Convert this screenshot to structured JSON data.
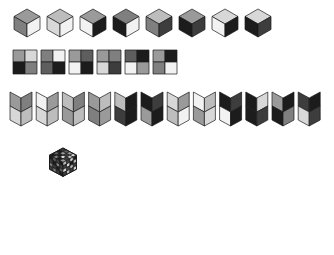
{
  "figure": {
    "background": "#ffffff",
    "outline_color": "#1a1a1a",
    "palette": {
      "black": "#1c1c1c",
      "dark": "#3d3d3d",
      "mid_dark": "#5e5e5e",
      "mid": "#7f7f7f",
      "mid_light": "#9a9a9a",
      "light": "#bdbdbd",
      "lighter": "#d8d8d8",
      "white": "#f2f2f2"
    }
  },
  "rows": [
    {
      "name": "cube-row",
      "label": "Row 1 — isometric cubes",
      "count": 8,
      "origin_x": 14,
      "origin_y": 9,
      "step_x": 33,
      "cube_half_width": 13,
      "cube_top_height": 7.5,
      "cube_side_height": 13,
      "items": [
        {
          "id": "cube-1",
          "top": "#9a9a9a",
          "left": "#7f7f7f",
          "right": "#f2f2f2"
        },
        {
          "id": "cube-2",
          "top": "#bdbdbd",
          "left": "#d8d8d8",
          "right": "#f2f2f2"
        },
        {
          "id": "cube-3",
          "top": "#9a9a9a",
          "left": "#f2f2f2",
          "right": "#1c1c1c"
        },
        {
          "id": "cube-4",
          "top": "#7f7f7f",
          "left": "#1c1c1c",
          "right": "#f2f2f2"
        },
        {
          "id": "cube-5",
          "top": "#bdbdbd",
          "left": "#7f7f7f",
          "right": "#3d3d3d"
        },
        {
          "id": "cube-6",
          "top": "#9a9a9a",
          "left": "#1c1c1c",
          "right": "#3d3d3d"
        },
        {
          "id": "cube-7",
          "top": "#d8d8d8",
          "left": "#f2f2f2",
          "right": "#1c1c1c"
        },
        {
          "id": "cube-8",
          "top": "#d8d8d8",
          "left": "#1c1c1c",
          "right": "#3d3d3d"
        }
      ]
    },
    {
      "name": "square-row",
      "label": "Row 2 — 2x2 checker squares",
      "count": 6,
      "origin_x": 13,
      "origin_y": 50,
      "step_x": 28,
      "cell": 12,
      "items": [
        {
          "id": "sq-1",
          "tl": "#9a9a9a",
          "tr": "#d8d8d8",
          "bl": "#1c1c1c",
          "br": "#7f7f7f"
        },
        {
          "id": "sq-2",
          "tl": "#7f7f7f",
          "tr": "#f2f2f2",
          "bl": "#5e5e5e",
          "br": "#1c1c1c"
        },
        {
          "id": "sq-3",
          "tl": "#9a9a9a",
          "tr": "#5e5e5e",
          "bl": "#f2f2f2",
          "br": "#1c1c1c"
        },
        {
          "id": "sq-4",
          "tl": "#9a9a9a",
          "tr": "#7f7f7f",
          "bl": "#d8d8d8",
          "br": "#3d3d3d"
        },
        {
          "id": "sq-5",
          "tl": "#5e5e5e",
          "tr": "#1c1c1c",
          "bl": "#f2f2f2",
          "br": "#9a9a9a"
        },
        {
          "id": "sq-6",
          "tl": "#9a9a9a",
          "tr": "#1c1c1c",
          "bl": "#7f7f7f",
          "br": "#f2f2f2"
        }
      ]
    },
    {
      "name": "chevron-row",
      "label": "Row 3 — chevron / folded-V shapes",
      "count": 12,
      "origin_x": 10,
      "origin_y": 92,
      "step_x": 26.2,
      "half_width": 11,
      "panel_height": 14,
      "fold_depth": 6,
      "items": [
        {
          "id": "chev-1",
          "tl": "#9a9a9a",
          "tr": "#7f7f7f",
          "bl": "#d8d8d8",
          "br": "#bdbdbd"
        },
        {
          "id": "chev-2",
          "tl": "#f2f2f2",
          "tr": "#9a9a9a",
          "bl": "#d8d8d8",
          "br": "#bdbdbd"
        },
        {
          "id": "chev-3",
          "tl": "#bdbdbd",
          "tr": "#7f7f7f",
          "bl": "#9a9a9a",
          "br": "#bdbdbd"
        },
        {
          "id": "chev-4",
          "tl": "#9a9a9a",
          "tr": "#bdbdbd",
          "bl": "#7f7f7f",
          "br": "#9a9a9a"
        },
        {
          "id": "chev-5",
          "tl": "#bdbdbd",
          "tr": "#1c1c1c",
          "bl": "#3d3d3d",
          "br": "#1c1c1c"
        },
        {
          "id": "chev-6",
          "tl": "#1c1c1c",
          "tr": "#3d3d3d",
          "bl": "#9a9a9a",
          "br": "#1c1c1c"
        },
        {
          "id": "chev-7",
          "tl": "#d8d8d8",
          "tr": "#9a9a9a",
          "bl": "#bdbdbd",
          "br": "#f2f2f2"
        },
        {
          "id": "chev-8",
          "tl": "#f2f2f2",
          "tr": "#bdbdbd",
          "bl": "#9a9a9a",
          "br": "#d8d8d8"
        },
        {
          "id": "chev-9",
          "tl": "#1c1c1c",
          "tr": "#3d3d3d",
          "bl": "#f2f2f2",
          "br": "#1c1c1c"
        },
        {
          "id": "chev-10",
          "tl": "#1c1c1c",
          "tr": "#d8d8d8",
          "bl": "#1c1c1c",
          "br": "#3d3d3d"
        },
        {
          "id": "chev-11",
          "tl": "#9a9a9a",
          "tr": "#1c1c1c",
          "bl": "#1c1c1c",
          "br": "#7f7f7f"
        },
        {
          "id": "chev-12",
          "tl": "#3d3d3d",
          "tr": "#1c1c1c",
          "bl": "#d8d8d8",
          "br": "#3d3d3d"
        }
      ]
    }
  ],
  "big_cube": {
    "name": "large-isometric-cube",
    "label": "4x4x4 shaded isometric cube",
    "dimension": 4,
    "center_x": 63,
    "apex_y": 148,
    "cell_half_width": 13.5,
    "cell_half_height": 7.2,
    "cell_depth": 14.0,
    "faces": {
      "top": [
        [
          "#3d3d3d",
          "#5e5e5e",
          "#9a9a9a",
          "#d8d8d8"
        ],
        [
          "#1c1c1c",
          "#9a9a9a",
          "#3d3d3d",
          "#bdbdbd"
        ],
        [
          "#5e5e5e",
          "#1c1c1c",
          "#d8d8d8",
          "#3d3d3d"
        ],
        [
          "#1c1c1c",
          "#7f7f7f",
          "#1c1c1c",
          "#9a9a9a"
        ]
      ],
      "left": [
        [
          "#1c1c1c",
          "#5e5e5e",
          "#3d3d3d",
          "#1c1c1c"
        ],
        [
          "#3d3d3d",
          "#1c1c1c",
          "#7f7f7f",
          "#3d3d3d"
        ],
        [
          "#7f7f7f",
          "#3d3d3d",
          "#1c1c1c",
          "#5e5e5e"
        ],
        [
          "#3d3d3d",
          "#7f7f7f",
          "#3d3d3d",
          "#1c1c1c"
        ]
      ],
      "right": [
        [
          "#1c1c1c",
          "#d8d8d8",
          "#3d3d3d",
          "#bdbdbd"
        ],
        [
          "#bdbdbd",
          "#1c1c1c",
          "#d8d8d8",
          "#3d3d3d"
        ],
        [
          "#3d3d3d",
          "#bdbdbd",
          "#3d3d3d",
          "#d8d8d8"
        ],
        [
          "#d8d8d8",
          "#3d3d3d",
          "#bdbdbd",
          "#3d3d3d"
        ]
      ]
    }
  }
}
